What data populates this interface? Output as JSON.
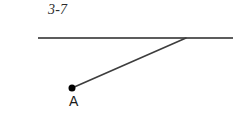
{
  "figure": {
    "caption": "3-7",
    "background_color": "#ffffff",
    "width": 247,
    "height": 137,
    "kind": "geometry-diagram"
  },
  "labels": {
    "point_a": "A"
  },
  "colors": {
    "horizontal_line": "#5c5c5c",
    "ray_line": "#3d3d3d",
    "point_fill": "#000000",
    "text": "#1a1a1a",
    "caption_text": "#2b2b2b"
  },
  "chart_data": {
    "type": "scatter",
    "title": "3-7",
    "xlabel": "",
    "ylabel": "",
    "xlim": [
      0,
      247
    ],
    "ylim": [
      137,
      0
    ],
    "grid": false,
    "legend": "none",
    "points": [
      {
        "name": "A",
        "x": 72,
        "y": 88,
        "label": "A",
        "marker": "filled-circle",
        "radius": 3.5
      },
      {
        "name": "vertex",
        "x": 186,
        "y": 38,
        "label": "",
        "marker": "none",
        "radius": 0
      }
    ],
    "segments": [
      {
        "name": "horizontal-line",
        "x": [
          38,
          233
        ],
        "y": [
          38,
          38
        ],
        "color": "#5c5c5c",
        "width": 2
      },
      {
        "name": "ray-a-to-vertex",
        "x": [
          72,
          186
        ],
        "y": [
          88,
          38
        ],
        "color": "#3d3d3d",
        "width": 1.6
      }
    ],
    "annotations": [
      {
        "text": "3-7",
        "x": 48,
        "y": 12,
        "style": "italic"
      },
      {
        "text": "A",
        "x": 74,
        "y": 104,
        "style": "normal"
      }
    ]
  }
}
